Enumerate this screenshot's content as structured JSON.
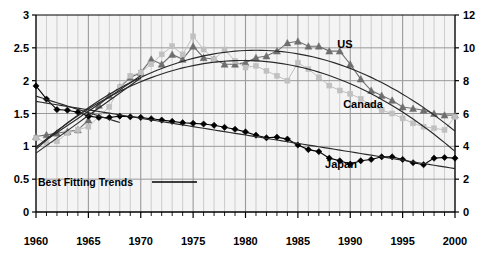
{
  "chart_data": {
    "type": "line",
    "title": "",
    "subtitle": "",
    "xlabel": "",
    "ylabel": "",
    "ylabel_right": "",
    "xlim": [
      1960,
      2000
    ],
    "ylim": [
      0,
      3
    ],
    "ylim_right": [
      0,
      12
    ],
    "grid": true,
    "grid_minor_x": "every year",
    "legend_position": "inline-annotations",
    "x_ticks": [
      1960,
      1965,
      1970,
      1975,
      1980,
      1985,
      1990,
      1995,
      2000
    ],
    "x_tick_labels": [
      "1960",
      "1965",
      "1970",
      "1975",
      "1980",
      "1985",
      "1990",
      "1995",
      "2000"
    ],
    "y_ticks_left": [
      0,
      0.5,
      1,
      1.5,
      2,
      2.5,
      3
    ],
    "y_tick_labels_left": [
      "0",
      "0.5",
      "1",
      "1.5",
      "2",
      "2.5",
      "3"
    ],
    "y_ticks_right": [
      0,
      2,
      4,
      6,
      8,
      10,
      12
    ],
    "y_tick_labels_right": [
      "0",
      "2",
      "4",
      "6",
      "8",
      "10",
      "12"
    ],
    "x": [
      1960,
      1961,
      1962,
      1963,
      1964,
      1965,
      1966,
      1967,
      1968,
      1969,
      1970,
      1971,
      1972,
      1973,
      1974,
      1975,
      1976,
      1977,
      1978,
      1979,
      1980,
      1981,
      1982,
      1983,
      1984,
      1985,
      1986,
      1987,
      1988,
      1989,
      1990,
      1991,
      1992,
      1993,
      1994,
      1995,
      1996,
      1997,
      1998,
      1999,
      2000
    ],
    "series": [
      {
        "name": "US",
        "axis": "right",
        "marker": "triangle",
        "color": "#6e6e6e",
        "values": [
          4.6,
          4.7,
          4.8,
          4.9,
          5.0,
          5.6,
          6.5,
          7.1,
          7.6,
          8.2,
          8.5,
          9.3,
          9.0,
          9.6,
          9.3,
          10.1,
          9.4,
          9.3,
          9.0,
          9.0,
          9.1,
          9.4,
          9.5,
          9.8,
          10.3,
          10.4,
          10.1,
          10.1,
          9.8,
          9.8,
          9.0,
          8.1,
          7.4,
          7.1,
          6.8,
          6.4,
          6.3,
          6.2,
          6.0,
          5.9,
          5.9
        ]
      },
      {
        "name": "Canada",
        "axis": "right",
        "marker": "square",
        "color": "#c0c0c0",
        "values": [
          4.5,
          4.2,
          4.3,
          4.8,
          5.0,
          5.2,
          5.8,
          6.4,
          7.6,
          8.3,
          8.5,
          9.0,
          9.6,
          10.1,
          9.6,
          10.7,
          9.9,
          9.3,
          9.9,
          9.2,
          8.8,
          8.9,
          8.6,
          8.3,
          8.0,
          9.1,
          8.7,
          8.2,
          7.7,
          7.4,
          7.2,
          6.9,
          6.5,
          6.2,
          6.0,
          5.7,
          5.4,
          5.2,
          5.1,
          5.0,
          5.8
        ]
      },
      {
        "name": "Japan",
        "axis": "left",
        "marker": "diamond",
        "color": "#000000",
        "values": [
          1.92,
          1.72,
          1.56,
          1.55,
          1.52,
          1.46,
          1.44,
          1.44,
          1.46,
          1.45,
          1.44,
          1.42,
          1.4,
          1.38,
          1.36,
          1.35,
          1.34,
          1.32,
          1.29,
          1.26,
          1.22,
          1.17,
          1.13,
          1.14,
          1.11,
          1.02,
          0.95,
          0.92,
          0.82,
          0.78,
          0.73,
          0.78,
          0.8,
          0.84,
          0.84,
          0.8,
          0.75,
          0.72,
          0.82,
          0.83,
          0.82
        ]
      }
    ],
    "trend_curves": [
      {
        "name": "US best-fitting trend",
        "for_series": "US",
        "axis": "right",
        "type": "quadratic"
      },
      {
        "name": "Canada best-fitting trend",
        "for_series": "Canada",
        "axis": "right",
        "type": "quadratic"
      },
      {
        "name": "Japan best-fitting trend",
        "for_series": "Japan",
        "axis": "left",
        "type": "linear"
      },
      {
        "name": "Japan early steep trend",
        "for_series": "Japan",
        "axis": "left",
        "type": "linear-early"
      }
    ],
    "annotations": [
      {
        "text": "US",
        "x": 1990,
        "y_right": 10.9,
        "px": 345,
        "py": 45
      },
      {
        "text": "Canada",
        "x": 1991,
        "y_right": 7.1,
        "px": 363,
        "py": 105
      },
      {
        "text": "Japan",
        "x": 1986,
        "y_left": 0.93,
        "px": 340,
        "py": 165
      },
      {
        "text": "Best Fitting Trends",
        "px": 100,
        "py": 182,
        "has_line_sample": true
      }
    ],
    "colors": {
      "us": "#6e6e6e",
      "canada": "#c0c0c0",
      "japan": "#000000",
      "trend": "#2a2a2a",
      "grid_major": "#999999",
      "grid_minor": "#bbbbbb",
      "plot_background": "#f4f4f4",
      "axis": "#000000"
    }
  },
  "legend": {
    "best_fitting_trends": "Best Fitting Trends"
  },
  "labels": {
    "us": "US",
    "canada": "Canada",
    "japan": "Japan"
  }
}
